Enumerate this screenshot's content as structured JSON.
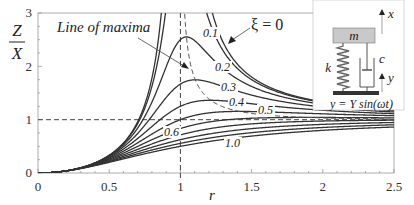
{
  "chart_data": {
    "type": "line",
    "title": "",
    "xlabel": "r",
    "ylabel_numerator": "Z",
    "ylabel_denominator": "X",
    "xlim": [
      0,
      2.5
    ],
    "ylim": [
      0,
      3
    ],
    "xticks": [
      "0",
      "0.5",
      "1",
      "1.5",
      "2",
      "2.5"
    ],
    "yticks": [
      "0",
      "1",
      "2",
      "3"
    ],
    "grid": false,
    "formula": "Z/X = r^2 / sqrt((1 - r^2)^2 + (2 xi r)^2)",
    "series": [
      {
        "name": "ξ = 0",
        "xi": 0
      },
      {
        "name": "0.1",
        "xi": 0.1
      },
      {
        "name": "0.2",
        "xi": 0.2
      },
      {
        "name": "0.3",
        "xi": 0.3
      },
      {
        "name": "0.4",
        "xi": 0.4
      },
      {
        "name": "0.5",
        "xi": 0.5
      },
      {
        "name": "0.6",
        "xi": 0.6
      },
      {
        "name": "0.7",
        "xi": 0.7
      },
      {
        "name": "0.8",
        "xi": 0.8
      },
      {
        "name": "0.9",
        "xi": 0.9
      },
      {
        "name": "1.0",
        "xi": 1.0
      }
    ],
    "reference_lines": [
      {
        "type": "horizontal",
        "y": 1,
        "style": "dashed"
      },
      {
        "type": "vertical",
        "x": 1,
        "style": "dashed"
      }
    ],
    "annotations": [
      {
        "text": "Line of maxima",
        "style": "dashed curve through peaks"
      },
      {
        "text": "ξ = 0",
        "arrow": true
      },
      {
        "text": "0.1"
      },
      {
        "text": "0.2"
      },
      {
        "text": "0.3"
      },
      {
        "text": "0.4"
      },
      {
        "text": "0.5"
      },
      {
        "text": "0.6"
      },
      {
        "text": "1.0"
      }
    ],
    "inset_diagram": {
      "mass_label": "m",
      "spring_label": "k",
      "damper_label": "c",
      "mass_displacement": "x",
      "base_displacement": "y",
      "base_motion": "y = Y sin(ωt)"
    }
  },
  "labels": {
    "y_num": "Z",
    "y_den": "X",
    "x_axis": "r",
    "line_of_maxima": "Line of maxima",
    "xi_zero": "ξ = 0",
    "c01": "0.1",
    "c02": "0.2",
    "c03": "0.3",
    "c04": "0.4",
    "c05": "0.5",
    "c06": "0.6",
    "c10": "1.0",
    "x0": "0",
    "x05": "0.5",
    "x1": "1",
    "x15": "1.5",
    "x2": "2",
    "x25": "2.5",
    "y0": "0",
    "y1": "1",
    "y2": "2",
    "y3": "3",
    "mass": "m",
    "spring": "k",
    "damper": "c",
    "x_disp": "x",
    "y_disp": "y",
    "base_motion": "y = Y sin(ωt)"
  }
}
